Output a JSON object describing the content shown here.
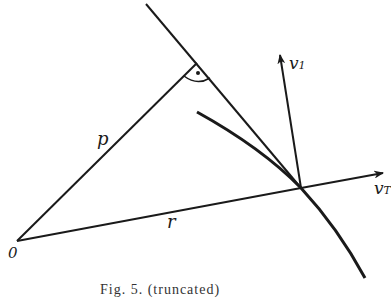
{
  "figure": {
    "labels": {
      "origin": "0",
      "p": "p",
      "r": "r",
      "v1_base": "v",
      "v1_sub": "1",
      "vt_base": "v",
      "vt_sub": "T"
    },
    "caption": "Fig. 5. (truncated)",
    "colors": {
      "stroke": "#1a1a1a",
      "background": "#ffffff"
    }
  }
}
